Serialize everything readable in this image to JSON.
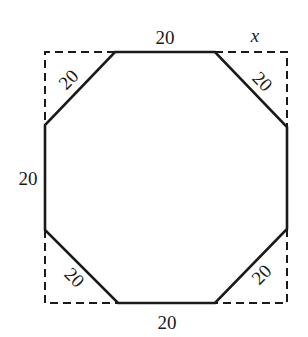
{
  "figure": {
    "colors": {
      "stroke": "#1a1a1a",
      "background": "#ffffff"
    },
    "square": {
      "style": "dashed",
      "left": 45,
      "top": 52,
      "right": 287,
      "bottom": 303
    },
    "octagon": {
      "style": "solid",
      "vertices": [
        [
          115,
          52
        ],
        [
          215,
          52
        ],
        [
          287,
          127
        ],
        [
          287,
          229
        ],
        [
          215,
          303
        ],
        [
          118,
          303
        ],
        [
          45,
          230
        ],
        [
          45,
          125
        ]
      ]
    },
    "labels": {
      "top_side": "20",
      "bottom_side": "20",
      "left_side": "20",
      "diag_top_left": "20",
      "diag_top_right": "20",
      "diag_bottom_left": "20",
      "diag_bottom_right": "20",
      "corner_variable": "x"
    }
  }
}
